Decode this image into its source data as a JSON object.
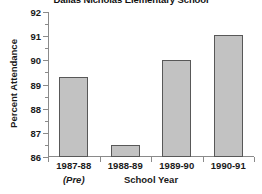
{
  "chart_data": {
    "type": "bar",
    "title": "Dallas Nicholas Elementary School",
    "xlabel": "School Year",
    "ylabel": "Percent Attendance",
    "categories": [
      "1987-88",
      "1988-89",
      "1989-90",
      "1990-91"
    ],
    "category_sublabels": [
      "(Pre)",
      "",
      "",
      ""
    ],
    "values": [
      89.3,
      86.5,
      90.0,
      91.05
    ],
    "ylim": [
      86,
      92
    ],
    "ytick_labels": [
      "86",
      "87",
      "88",
      "89",
      "90",
      "91",
      "92"
    ],
    "ytick_values": [
      86,
      87,
      88,
      89,
      90,
      91,
      92
    ],
    "yminor_step": 0.5,
    "grid": false,
    "legend": null,
    "bar_fill_color": "#c2c2c2",
    "bar_border_color": "#585858",
    "axis_color": "#8a8a8a",
    "background_color": "#ffffff"
  }
}
